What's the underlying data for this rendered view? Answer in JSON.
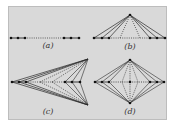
{
  "figure": {
    "background": "#d9d9d9",
    "line_color": "#2a2a2a",
    "point_color": "#111111",
    "panels": [
      {
        "id": "a",
        "label": "(a)",
        "label_pos": [
          48,
          48
        ],
        "points": [
          [
            11,
            38
          ],
          [
            18,
            38
          ],
          [
            25,
            38
          ],
          [
            64,
            38
          ],
          [
            71,
            38
          ],
          [
            79,
            38
          ]
        ],
        "solid_edges": [
          [
            0,
            1
          ],
          [
            1,
            2
          ],
          [
            3,
            4
          ],
          [
            4,
            5
          ]
        ],
        "dotted_edges": [
          [
            2,
            3
          ]
        ]
      },
      {
        "id": "b",
        "label": "(b)",
        "label_pos": [
          130,
          49
        ],
        "points": [
          [
            94,
            38
          ],
          [
            102,
            38
          ],
          [
            109,
            38
          ],
          [
            150,
            38
          ],
          [
            157,
            38
          ],
          [
            165,
            38
          ],
          [
            130,
            15
          ]
        ],
        "solid_edges": [
          [
            0,
            1
          ],
          [
            1,
            2
          ],
          [
            3,
            4
          ],
          [
            4,
            5
          ],
          [
            6,
            0
          ],
          [
            6,
            1
          ],
          [
            6,
            2
          ],
          [
            6,
            3
          ],
          [
            6,
            4
          ],
          [
            6,
            5
          ]
        ],
        "dotted_edges": [
          [
            2,
            3
          ],
          [
            6,
            2
          ],
          [
            6,
            3
          ]
        ],
        "extra_dotted": [
          [
            [
              130,
              15
            ],
            [
              120,
              38
            ]
          ],
          [
            [
              130,
              15
            ],
            [
              140,
              38
            ]
          ]
        ]
      },
      {
        "id": "c",
        "label": "(c)",
        "label_pos": [
          48,
          114
        ],
        "points": [
          [
            12,
            82
          ],
          [
            19,
            82
          ],
          [
            26,
            82
          ],
          [
            65,
            82
          ],
          [
            72,
            82
          ],
          [
            80,
            82
          ]
        ],
        "apex_top": [
          88,
          59
        ],
        "apex_bottom": [
          88,
          105
        ],
        "dotted_edges": [
          [
            2,
            3
          ]
        ]
      },
      {
        "id": "d",
        "label": "(d)",
        "label_pos": [
          130,
          114
        ],
        "points": [
          [
            95,
            82
          ],
          [
            102,
            82
          ],
          [
            109,
            82
          ],
          [
            130,
            82
          ],
          [
            150,
            82
          ],
          [
            157,
            82
          ],
          [
            164,
            82
          ]
        ],
        "top": [
          130,
          60
        ],
        "bottom": [
          130,
          103
        ]
      }
    ]
  }
}
